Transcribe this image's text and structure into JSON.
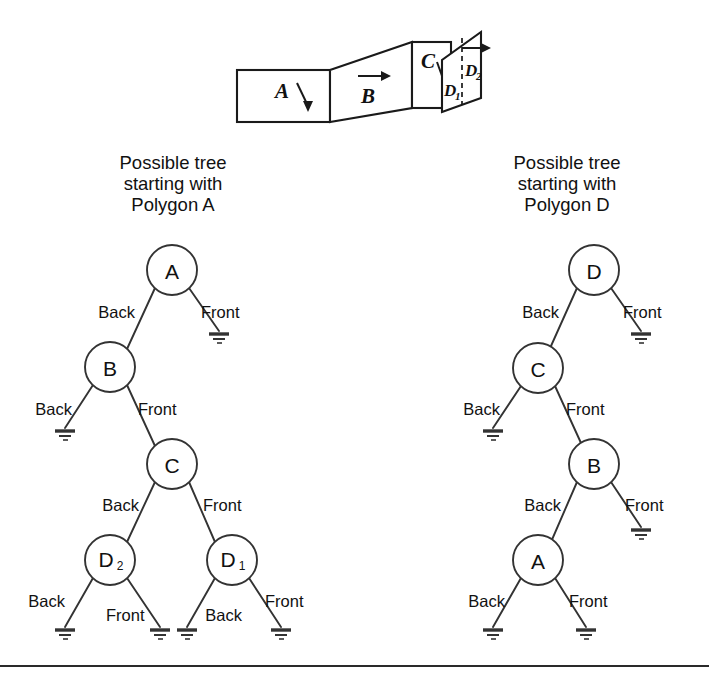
{
  "figure": {
    "title_left": "Possible tree\nstarting with\nPolygon A",
    "title_right": "Possible tree\nstarting with\nPolygon D",
    "edge_label_back": "Back",
    "edge_label_front": "Front"
  },
  "scene": {
    "panels": [
      {
        "id": "A",
        "label": "A",
        "sub": ""
      },
      {
        "id": "B",
        "label": "B",
        "sub": ""
      },
      {
        "id": "C",
        "label": "C",
        "sub": ""
      },
      {
        "id": "D1",
        "label": "D",
        "sub": "1"
      },
      {
        "id": "D2",
        "label": "D",
        "sub": "2"
      }
    ]
  },
  "tree_left": {
    "root": "A",
    "nodes": [
      {
        "id": "n-a",
        "label": "A",
        "sub": "",
        "cx": 172,
        "cy": 270
      },
      {
        "id": "n-b",
        "label": "B",
        "sub": "",
        "cx": 110,
        "cy": 367
      },
      {
        "id": "n-c",
        "label": "C",
        "sub": "",
        "cx": 172,
        "cy": 464
      },
      {
        "id": "n-d2",
        "label": "D",
        "sub": "2",
        "cx": 110,
        "cy": 560
      },
      {
        "id": "n-d1",
        "label": "D",
        "sub": "1",
        "cx": 232,
        "cy": 560
      }
    ],
    "edges": [
      {
        "from": "A",
        "to": "B",
        "label": "Back",
        "side": "left"
      },
      {
        "from": "A",
        "to": "nil",
        "label": "Front",
        "side": "right"
      },
      {
        "from": "B",
        "to": "nil",
        "label": "Back",
        "side": "left"
      },
      {
        "from": "B",
        "to": "C",
        "label": "Front",
        "side": "right"
      },
      {
        "from": "C",
        "to": "D2",
        "label": "Back",
        "side": "left"
      },
      {
        "from": "C",
        "to": "D1",
        "label": "Front",
        "side": "right"
      },
      {
        "from": "D2",
        "to": "nil",
        "label": "Back",
        "side": "left"
      },
      {
        "from": "D2",
        "to": "nil",
        "label": "Front",
        "side": "right"
      },
      {
        "from": "D1",
        "to": "nil",
        "label": "Back",
        "side": "left"
      },
      {
        "from": "D1",
        "to": "nil",
        "label": "Front",
        "side": "right"
      }
    ]
  },
  "tree_right": {
    "root": "D",
    "nodes": [
      {
        "id": "m-d",
        "label": "D",
        "sub": "",
        "cx": 594,
        "cy": 270
      },
      {
        "id": "m-c",
        "label": "C",
        "sub": "",
        "cx": 538,
        "cy": 368
      },
      {
        "id": "m-b",
        "label": "B",
        "sub": "",
        "cx": 594,
        "cy": 464
      },
      {
        "id": "m-a",
        "label": "A",
        "sub": "",
        "cx": 538,
        "cy": 560
      }
    ],
    "edges": [
      {
        "from": "D",
        "to": "C",
        "label": "Back",
        "side": "left"
      },
      {
        "from": "D",
        "to": "nil",
        "label": "Front",
        "side": "right"
      },
      {
        "from": "C",
        "to": "nil",
        "label": "Back",
        "side": "left"
      },
      {
        "from": "C",
        "to": "B",
        "label": "Front",
        "side": "right"
      },
      {
        "from": "B",
        "to": "A",
        "label": "Back",
        "side": "left"
      },
      {
        "from": "B",
        "to": "nil",
        "label": "Front",
        "side": "right"
      },
      {
        "from": "A",
        "to": "nil",
        "label": "Back",
        "side": "left"
      },
      {
        "from": "A",
        "to": "nil",
        "label": "Front",
        "side": "right"
      }
    ]
  },
  "colors": {
    "ink": "#1a1a1a",
    "stroke": "#333333",
    "background": "#ffffff"
  }
}
